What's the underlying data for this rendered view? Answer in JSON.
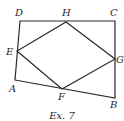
{
  "figure": {
    "caption": "Ex. 7",
    "points": {
      "A": {
        "label": "A",
        "x": 15,
        "y": 80
      },
      "B": {
        "label": "B",
        "x": 115,
        "y": 98
      },
      "C": {
        "label": "C",
        "x": 115,
        "y": 21
      },
      "D": {
        "label": "D",
        "x": 20,
        "y": 21
      },
      "E": {
        "label": "E",
        "x": 17,
        "y": 51
      },
      "F": {
        "label": "F",
        "x": 62,
        "y": 89
      },
      "G": {
        "label": "G",
        "x": 115,
        "y": 59
      },
      "H": {
        "label": "H",
        "x": 66,
        "y": 22
      }
    },
    "outer_quadrilateral": [
      "A",
      "B",
      "C",
      "D"
    ],
    "inner_quadrilateral": [
      "E",
      "F",
      "G",
      "H"
    ],
    "colors": {
      "stroke": "#2a2a2a",
      "background": "#ffffff"
    }
  }
}
